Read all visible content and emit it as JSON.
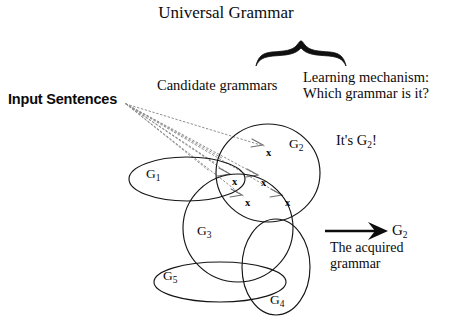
{
  "diagram": {
    "title": "Universal Grammar",
    "labels": {
      "candidate_grammars": "Candidate grammars",
      "learning_mechanism_line1": "Learning mechanism:",
      "learning_mechanism_line2": "Which grammar is it?",
      "input_sentences": "Input Sentences",
      "its_g2": "It's G",
      "its_g2_sub": "2",
      "its_g2_tail": "!",
      "acquired_line1": "The acquired",
      "acquired_line2": "grammar",
      "result_grammar": "G",
      "result_grammar_sub": "2"
    },
    "grammar_sets": [
      {
        "id": "G1",
        "base": "G",
        "sub": "1",
        "shape": "ellipse",
        "cx": 187,
        "cy": 179,
        "rx": 58,
        "ry": 22,
        "rotate": 0,
        "label_x": 146,
        "label_y": 167
      },
      {
        "id": "G2",
        "base": "G",
        "sub": "2",
        "shape": "circle",
        "cx": 268,
        "cy": 173,
        "rx": 52,
        "ry": 49,
        "rotate": 0,
        "label_x": 289,
        "label_y": 137
      },
      {
        "id": "G3",
        "base": "G",
        "sub": "3",
        "shape": "circle",
        "cx": 238,
        "cy": 228,
        "rx": 55,
        "ry": 54,
        "rotate": 0,
        "label_x": 197,
        "label_y": 224
      },
      {
        "id": "G4",
        "base": "G",
        "sub": "4",
        "shape": "ellipse",
        "cx": 276,
        "cy": 267,
        "rx": 34,
        "ry": 48,
        "rotate": 0,
        "label_x": 270,
        "label_y": 293
      },
      {
        "id": "G5",
        "base": "G",
        "sub": "5",
        "shape": "ellipse",
        "cx": 220,
        "cy": 282,
        "rx": 66,
        "ry": 20,
        "rotate": 0,
        "label_x": 163,
        "label_y": 269
      }
    ],
    "sentence_markers": [
      {
        "name": "sentence-x-1",
        "x": 266,
        "y": 147
      },
      {
        "name": "sentence-x-2",
        "x": 232,
        "y": 176
      },
      {
        "name": "sentence-x-3",
        "x": 261,
        "y": 177
      },
      {
        "name": "sentence-x-4",
        "x": 245,
        "y": 197
      },
      {
        "name": "sentence-x-5",
        "x": 285,
        "y": 197
      },
      {
        "name": "sentence-x-label",
        "text": "x"
      }
    ],
    "input_fan_origin": {
      "x": 126,
      "y": 104
    },
    "colors": {
      "ink": "#0b0b0b",
      "outline": "#1a1a1a",
      "dotted": "#8c8c8c",
      "background": "#ffffff"
    }
  }
}
